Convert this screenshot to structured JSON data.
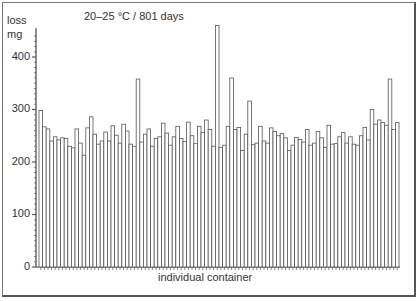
{
  "chart_data": {
    "type": "bar",
    "title": "20–25 °C / 801 days",
    "xlabel": "individual container",
    "ylabel": [
      "loss",
      "mg"
    ],
    "ylim": [
      0,
      460
    ],
    "yticks": [
      0,
      100,
      200,
      300,
      400
    ],
    "grid": false,
    "legend": null,
    "values": [
      298,
      267,
      263,
      240,
      248,
      242,
      246,
      245,
      230,
      227,
      263,
      236,
      213,
      265,
      286,
      253,
      234,
      240,
      257,
      240,
      269,
      251,
      236,
      272,
      259,
      234,
      230,
      358,
      238,
      253,
      263,
      230,
      245,
      248,
      274,
      255,
      232,
      248,
      268,
      245,
      239,
      276,
      250,
      235,
      268,
      256,
      280,
      262,
      230,
      460,
      228,
      232,
      268,
      360,
      262,
      266,
      222,
      253,
      316,
      233,
      236,
      268,
      240,
      236,
      265,
      258,
      250,
      254,
      246,
      222,
      232,
      247,
      243,
      238,
      262,
      232,
      236,
      258,
      246,
      228,
      270,
      234,
      235,
      248,
      256,
      236,
      248,
      234,
      232,
      250,
      266,
      242,
      300,
      272,
      280,
      275,
      270,
      358,
      262,
      275
    ],
    "bar_color": "#ffffff",
    "edge_color": "#555555"
  },
  "labels": {
    "title": "20–25 °C / 801 days",
    "y_top": "loss",
    "y_unit": "mg",
    "x_axis": "individual container",
    "ticks": [
      "0",
      "100",
      "200",
      "300",
      "400"
    ]
  }
}
